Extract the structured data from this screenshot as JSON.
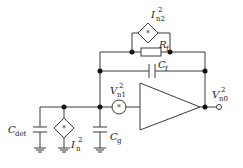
{
  "diagram": {
    "type": "circuit-schematic",
    "components": [
      {
        "id": "In2_source",
        "label": "I",
        "sub": "n2",
        "sup": "2",
        "kind": "noise-current-source"
      },
      {
        "id": "Rf",
        "label": "R",
        "sub": "f",
        "kind": "resistor"
      },
      {
        "id": "Cf",
        "label": "C",
        "sub": "f",
        "kind": "capacitor"
      },
      {
        "id": "Vn1_source",
        "label": "V",
        "sub": "n1",
        "sup": "2",
        "kind": "noise-voltage-source"
      },
      {
        "id": "opamp",
        "kind": "amplifier"
      },
      {
        "id": "Vn0_output",
        "label": "V",
        "sub": "n0",
        "sup": "2",
        "kind": "output-terminal"
      },
      {
        "id": "Cdet",
        "label": "C",
        "sub": "det",
        "kind": "capacitor"
      },
      {
        "id": "In_source",
        "label": "I",
        "sub": "n",
        "sup": "2",
        "kind": "noise-current-source"
      },
      {
        "id": "Cg",
        "label": "C",
        "sub": "g",
        "kind": "capacitor"
      }
    ],
    "colors": {
      "wire": "#3a3a3a",
      "node": "#111111",
      "ground": "#888888"
    }
  }
}
